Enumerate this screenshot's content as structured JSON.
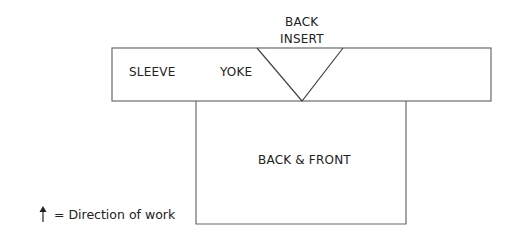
{
  "diagram": {
    "type": "garment-schematic",
    "pieces": {
      "sleeve_yoke_band": {
        "label_sleeve": "SLEEVE",
        "label_yoke": "YOKE"
      },
      "back_insert": {
        "line1": "BACK",
        "line2": "INSERT"
      },
      "body": {
        "label": "BACK & FRONT"
      }
    },
    "legend": {
      "icon": "up-arrow-icon",
      "text": "= Direction of work"
    },
    "colors": {
      "line": "#6b6b6b",
      "text": "#222222",
      "background": "#ffffff"
    }
  }
}
